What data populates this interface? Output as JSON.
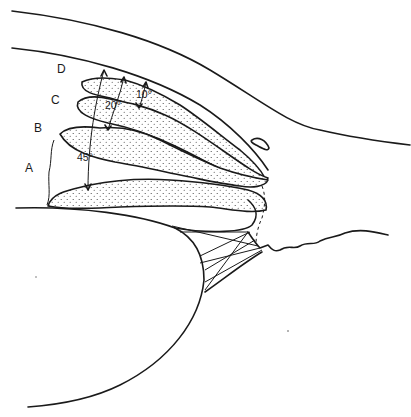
{
  "diagram": {
    "type": "anatomical line drawing",
    "labels": {
      "A": "A",
      "B": "B",
      "C": "C",
      "D": "D"
    },
    "angles": {
      "a10": "10°",
      "a20": "20°",
      "a45": "45°"
    },
    "colors": {
      "ink": "#1a1a1a",
      "background": "#ffffff"
    }
  }
}
